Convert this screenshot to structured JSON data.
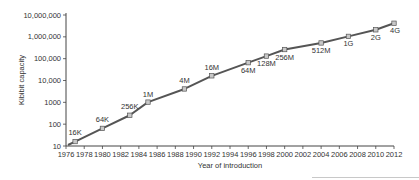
{
  "chart_data": {
    "type": "line",
    "title": "",
    "xlabel": "Year of introduction",
    "ylabel": "Kibibit capacity",
    "yscale": "log",
    "xlim": [
      1976,
      2012
    ],
    "ylim": [
      10,
      10000000
    ],
    "grid": false,
    "legend": null,
    "x_ticks": [
      1976,
      1978,
      1980,
      1982,
      1984,
      1986,
      1988,
      1990,
      1992,
      1994,
      1996,
      1998,
      2000,
      2002,
      2004,
      2006,
      2008,
      2010,
      2012
    ],
    "y_ticks": [
      10,
      100,
      1000,
      10000,
      100000,
      1000000,
      10000000
    ],
    "y_tick_labels": [
      "10",
      "100",
      "1000",
      "10,000",
      "100,000",
      "1,000,000",
      "10,000,000"
    ],
    "series": [
      {
        "name": "DRAM capacity",
        "color": "#555555",
        "points": [
          {
            "x": 1977,
            "y": 16,
            "label": "16K",
            "label_pos": "above-left"
          },
          {
            "x": 1980,
            "y": 64,
            "label": "64K",
            "label_pos": "above"
          },
          {
            "x": 1983,
            "y": 256,
            "label": "256K",
            "label_pos": "above"
          },
          {
            "x": 1985,
            "y": 1024,
            "label": "1M",
            "label_pos": "above"
          },
          {
            "x": 1989,
            "y": 4096,
            "label": "4M",
            "label_pos": "above"
          },
          {
            "x": 1992,
            "y": 16384,
            "label": "16M",
            "label_pos": "above"
          },
          {
            "x": 1996,
            "y": 65536,
            "label": "64M",
            "label_pos": "below"
          },
          {
            "x": 1998,
            "y": 131072,
            "label": "128M",
            "label_pos": "below"
          },
          {
            "x": 2000,
            "y": 262144,
            "label": "256M",
            "label_pos": "below"
          },
          {
            "x": 2004,
            "y": 524288,
            "label": "512M",
            "label_pos": "below"
          },
          {
            "x": 2007,
            "y": 1048576,
            "label": "1G",
            "label_pos": "below"
          },
          {
            "x": 2010,
            "y": 2097152,
            "label": "2G",
            "label_pos": "below"
          },
          {
            "x": 2012,
            "y": 4194304,
            "label": "4G",
            "label_pos": "below"
          }
        ]
      }
    ]
  },
  "layout": {
    "plot": {
      "x0": 66,
      "x1": 394,
      "y_bottom": 146,
      "y_top": 15
    },
    "line_color": "#555555",
    "marker_fill": "#c8c8c8",
    "marker_stroke": "#555555",
    "axis_color": "#444444"
  }
}
